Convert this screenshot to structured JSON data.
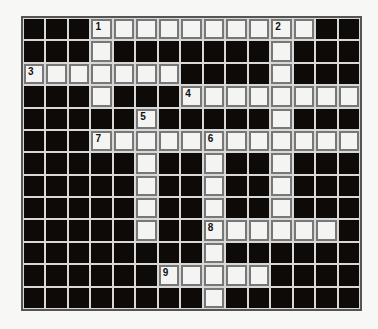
{
  "puzzle": {
    "rows": 13,
    "cols": 15,
    "colors": {
      "block": "#0d0a08",
      "open": "#f4f4f2",
      "gridline": "#d8d8d8",
      "border": "#555555"
    },
    "layout": [
      "###1.......2.##",
      "###.#######.###",
      "3......####.###",
      "###.###4.......",
      "#####5#####.###",
      "###7....6......",
      "#####.##.##.###",
      "#####.##.##.###",
      "#####.##.##.###",
      "#####.##8.....#",
      "########.######",
      "######9....####",
      "########.######"
    ],
    "numbers": [
      {
        "label": "1",
        "row": 0,
        "col": 3
      },
      {
        "label": "2",
        "row": 0,
        "col": 11
      },
      {
        "label": "3",
        "row": 2,
        "col": 0
      },
      {
        "label": "4",
        "row": 3,
        "col": 7
      },
      {
        "label": "5",
        "row": 4,
        "col": 5
      },
      {
        "label": "7",
        "row": 5,
        "col": 3
      },
      {
        "label": "6",
        "row": 5,
        "col": 8
      },
      {
        "label": "8",
        "row": 9,
        "col": 8
      },
      {
        "label": "9",
        "row": 11,
        "col": 6
      }
    ]
  }
}
